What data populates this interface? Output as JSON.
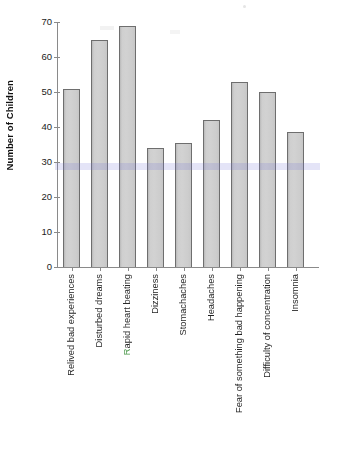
{
  "chart_data": {
    "type": "bar",
    "title": "",
    "xlabel": "",
    "ylabel": "Number of Children",
    "ylim": [
      0,
      70
    ],
    "yticks": [
      0,
      10,
      20,
      30,
      40,
      50,
      60,
      70
    ],
    "grid": false,
    "legend": "none",
    "categories": [
      "Relived bad experiences",
      "Disturbed dreams",
      "Rapid heart beating",
      "Dizziness",
      "Stomachaches",
      "Headaches",
      "Fear of something bad happening",
      "Difficulty of concentration",
      "Insomnia"
    ],
    "values": [
      51,
      65,
      69,
      34,
      35.5,
      42,
      53,
      50,
      38.5
    ],
    "bar_color": "#cfcfcf",
    "bar_border_color": "#6e6e6e",
    "axis_color": "#8a8a8a",
    "text_color": "#1c1c1c",
    "background": "#ffffff"
  },
  "axis": {
    "y_title": "Number of Children",
    "y_tick_labels": [
      "70",
      "60",
      "50",
      "40",
      "30",
      "20",
      "10",
      "0"
    ]
  }
}
